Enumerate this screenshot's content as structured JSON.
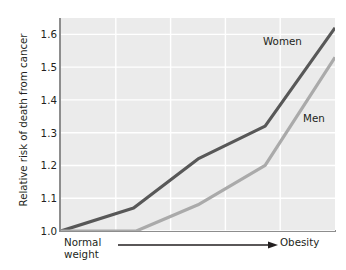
{
  "chart_data": {
    "type": "line",
    "title": "",
    "subtitle": "",
    "xlabel": "",
    "ylabel": "Relative risk of death from cancer",
    "ylim": [
      1.0,
      1.65
    ],
    "xlim": [
      0,
      10
    ],
    "grid": true,
    "legend_position": "inline-right",
    "y_ticks": [
      "1.0",
      "1.1",
      "1.2",
      "1.3",
      "1.4",
      "1.5",
      "1.6"
    ],
    "y_tick_values": [
      1.0,
      1.1,
      1.2,
      1.3,
      1.4,
      1.5,
      1.6
    ],
    "x_axis_start_label": "Normal\nweight",
    "x_axis_start_label_line1": "Normal",
    "x_axis_start_label_line2": "weight",
    "x_axis_end_label": "Obesity",
    "x_axis_arrow": "right-arrow",
    "series": [
      {
        "name": "Women",
        "color": "#585858",
        "x": [
          0.0,
          2.65,
          5.0,
          7.45,
          10.0
        ],
        "values": [
          1.0,
          1.07,
          1.22,
          1.32,
          1.62
        ]
      },
      {
        "name": "Men",
        "color": "#aaaaaa",
        "x": [
          0.0,
          2.75,
          5.0,
          7.45,
          10.0
        ],
        "values": [
          1.0,
          1.0,
          1.08,
          1.2,
          1.53
        ]
      }
    ],
    "colors": {
      "plot_background": "#ebebeb",
      "gridline": "#ffffff",
      "axis_spine": "#8d8d8d",
      "women_line": "#585858",
      "men_line": "#aaaaaa",
      "text": "#231f20",
      "page_background": "#ffffff"
    }
  },
  "labels": {
    "y_axis_title": "Relative risk of death from cancer",
    "women": "Women",
    "men": "Men",
    "normal_weight_line1": "Normal",
    "normal_weight_line2": "weight",
    "obesity": "Obesity"
  }
}
